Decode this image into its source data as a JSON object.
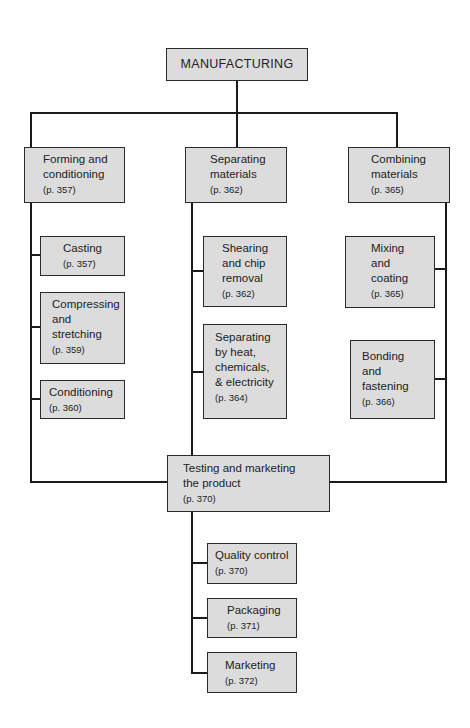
{
  "root": {
    "label": "MANUFACTURING"
  },
  "categories": [
    {
      "label": "Forming and\nconditioning",
      "page": "(p. 357)",
      "children": [
        {
          "label": "Casting",
          "page": "(p. 357)"
        },
        {
          "label": "Compressing\nand\nstretching",
          "page": "(p. 359)"
        },
        {
          "label": "Conditioning",
          "page": "(p. 360)"
        }
      ]
    },
    {
      "label": "Separating\nmaterials",
      "page": "(p. 362)",
      "children": [
        {
          "label": "Shearing\nand chip\nremoval",
          "page": "(p. 362)"
        },
        {
          "label": "Separating\nby heat,\nchemicals,\n& electricity",
          "page": "(p. 364)"
        }
      ]
    },
    {
      "label": "Combining\nmaterials",
      "page": "(p. 365)",
      "children": [
        {
          "label": "Mixing\nand\ncoating",
          "page": "(p. 365)"
        },
        {
          "label": "Bonding\nand\nfastening",
          "page": "(p. 366)"
        }
      ]
    }
  ],
  "final": {
    "label": "Testing and marketing\nthe product",
    "page": "(p. 370)",
    "children": [
      {
        "label": "Quality control",
        "page": "(p. 370)"
      },
      {
        "label": "Packaging",
        "page": "(p. 371)"
      },
      {
        "label": "Marketing",
        "page": "(p. 372)"
      }
    ]
  },
  "colors": {
    "box_fill": "#dcdcdc",
    "line": "#1a1a1a",
    "background": "#ffffff"
  }
}
